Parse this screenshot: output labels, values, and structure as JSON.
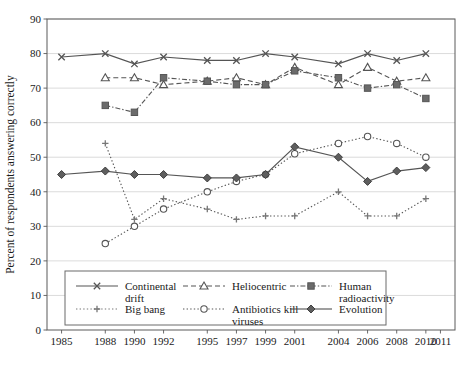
{
  "chart_data": {
    "type": "line",
    "title": "",
    "xlabel": "",
    "ylabel": "Percent of respondents answering correctly",
    "xlim": [
      1984,
      2012
    ],
    "ylim": [
      0,
      90
    ],
    "ytick_step": 10,
    "grid": true,
    "legend_position": "inside-bottom",
    "x": [
      1985,
      1988,
      1990,
      1992,
      1995,
      1997,
      1999,
      2001,
      2004,
      2006,
      2008,
      2010
    ],
    "xticks": [
      "1985",
      "1988",
      "1990",
      "1992",
      "1995",
      "1997",
      "1999",
      "2001",
      "2004",
      "2006",
      "2008",
      "2010",
      "2011"
    ],
    "xtick_values": [
      1985,
      1988,
      1990,
      1992,
      1995,
      1997,
      1999,
      2001,
      2004,
      2006,
      2008,
      2010,
      2011
    ],
    "yticks": [
      "0",
      "10",
      "20",
      "30",
      "40",
      "50",
      "60",
      "70",
      "80",
      "90"
    ],
    "ytick_values": [
      0,
      10,
      20,
      30,
      40,
      50,
      60,
      70,
      80,
      90
    ],
    "series": [
      {
        "name": "Continental drift",
        "legend_label": "Continental drift",
        "marker": "x",
        "dash": "none",
        "color": "#555555",
        "x": [
          1985,
          1988,
          1990,
          1992,
          1995,
          1997,
          1999,
          2001,
          2004,
          2006,
          2008,
          2010
        ],
        "values": [
          79,
          80,
          77,
          79,
          78,
          78,
          80,
          79,
          77,
          80,
          78,
          80
        ]
      },
      {
        "name": "Heliocentric",
        "legend_label": "Heliocentric",
        "marker": "triangle",
        "dash": "dashed",
        "color": "#555555",
        "x": [
          1988,
          1990,
          1992,
          1995,
          1997,
          1999,
          2001,
          2004,
          2006,
          2008,
          2010
        ],
        "values": [
          73,
          73,
          71,
          72,
          73,
          71,
          76,
          71,
          76,
          72,
          73
        ]
      },
      {
        "name": "Human radioactivity",
        "legend_label": "Human radioactivity",
        "marker": "square",
        "dash": "dashdot",
        "color": "#555555",
        "x": [
          1988,
          1990,
          1992,
          1995,
          1997,
          1999,
          2001,
          2004,
          2006,
          2008,
          2010
        ],
        "values": [
          65,
          63,
          73,
          72,
          71,
          71,
          75,
          73,
          70,
          71,
          67
        ]
      },
      {
        "name": "Big bang",
        "legend_label": "Big bang",
        "marker": "plus",
        "dash": "dotted",
        "color": "#777777",
        "x": [
          1988,
          1990,
          1992,
          1995,
          1997,
          1999,
          2001,
          2004,
          2006,
          2008,
          2010
        ],
        "values": [
          54,
          32,
          38,
          35,
          32,
          33,
          33,
          40,
          33,
          33,
          38
        ]
      },
      {
        "name": "Antibiotics kill viruses",
        "legend_label": "Antibiotics kill viruses",
        "marker": "circle",
        "dash": "dotted",
        "color": "#555555",
        "x": [
          1988,
          1990,
          1992,
          1995,
          1997,
          1999,
          2001,
          2004,
          2006,
          2008,
          2010
        ],
        "values": [
          25,
          30,
          35,
          40,
          43,
          45,
          51,
          54,
          56,
          54,
          50
        ]
      },
      {
        "name": "Evolution",
        "legend_label": "Evolution",
        "marker": "diamond",
        "dash": "none",
        "color": "#404040",
        "x": [
          1985,
          1988,
          1990,
          1992,
          1995,
          1997,
          1999,
          2001,
          2004,
          2006,
          2008,
          2010
        ],
        "values": [
          45,
          46,
          45,
          45,
          44,
          44,
          45,
          53,
          50,
          43,
          46,
          47
        ]
      }
    ]
  },
  "legend": {
    "entries": [
      {
        "label": "Continental drift",
        "marker": "x",
        "dash": "none"
      },
      {
        "label": "Heliocentric",
        "marker": "triangle",
        "dash": "dashed"
      },
      {
        "label": "Human radioactivity",
        "marker": "square",
        "dash": "dashdot"
      },
      {
        "label": "Big bang",
        "marker": "plus",
        "dash": "dotted"
      },
      {
        "label": "Antibiotics kill viruses",
        "marker": "circle",
        "dash": "dotted"
      },
      {
        "label": "Evolution",
        "marker": "diamond",
        "dash": "none"
      }
    ]
  }
}
